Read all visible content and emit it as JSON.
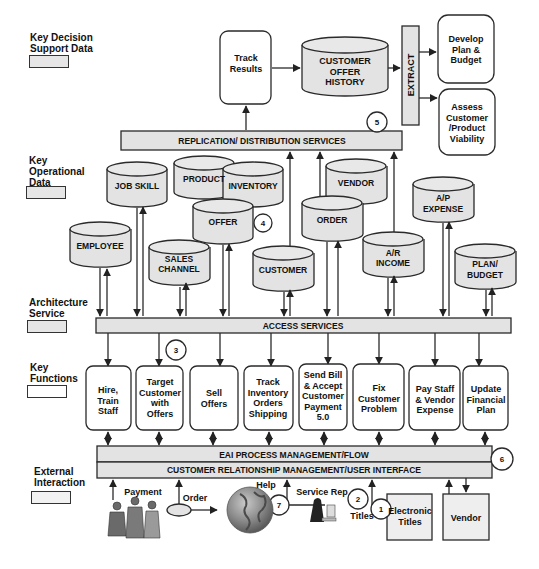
{
  "legend": [
    {
      "label": "Key Decision Support Data",
      "lines": [
        "Key  Decision",
        "Support  Data"
      ],
      "swatch_color": "#e6e6e6"
    },
    {
      "label": "Key Operational Data",
      "lines": [
        "Key",
        "Operational",
        "Data"
      ],
      "swatch_color": "#e6e6e6"
    },
    {
      "label": "Architecture Service",
      "lines": [
        "Architecture",
        "Service"
      ],
      "swatch_color": "#e6e6e6"
    },
    {
      "label": "Key Functions",
      "lines": [
        "Key",
        "Functions"
      ],
      "swatch_color": "#ffffff"
    },
    {
      "label": "External Interaction",
      "lines": [
        "External",
        "Interaction"
      ],
      "swatch_color": "#f2f2f2"
    }
  ],
  "decision_support": {
    "track_results": [
      "Track",
      "Results"
    ],
    "customer_offer_history": [
      "CUSTOMER",
      "OFFER",
      "HISTORY"
    ],
    "extract": "EXTRACT",
    "develop_plan": [
      "Develop",
      "Plan &",
      "Budget"
    ],
    "assess_viability": [
      "Assess",
      "Customer",
      "/Product",
      "Viability"
    ]
  },
  "services": {
    "replication": "REPLICATION/ DISTRIBUTION SERVICES",
    "access": "ACCESS SERVICES",
    "eai": "EAI PROCESS MANAGEMENT/FLOW",
    "crm": "CUSTOMER RELATIONSHIP MANAGEMENT/USER INTERFACE"
  },
  "operational_data": [
    {
      "id": "job-skill",
      "lines": [
        "JOB SKILL"
      ]
    },
    {
      "id": "product",
      "lines": [
        "PRODUCT"
      ]
    },
    {
      "id": "inventory",
      "lines": [
        "INVENTORY"
      ]
    },
    {
      "id": "vendor",
      "lines": [
        "VENDOR"
      ]
    },
    {
      "id": "offer",
      "lines": [
        "OFFER"
      ]
    },
    {
      "id": "order",
      "lines": [
        "ORDER"
      ]
    },
    {
      "id": "a-p-expense",
      "lines": [
        "A/P",
        "EXPENSE"
      ]
    },
    {
      "id": "employee",
      "lines": [
        "EMPLOYEE"
      ]
    },
    {
      "id": "sales-channel",
      "lines": [
        "SALES",
        "CHANNEL"
      ]
    },
    {
      "id": "customer",
      "lines": [
        "CUSTOMER"
      ]
    },
    {
      "id": "a-r-income",
      "lines": [
        "A/R",
        "INCOME"
      ]
    },
    {
      "id": "plan-budget",
      "lines": [
        "PLAN/",
        "BUDGET"
      ]
    }
  ],
  "functions": [
    {
      "id": "hire-train-staff",
      "lines": [
        "Hire,",
        "Train",
        "Staff"
      ]
    },
    {
      "id": "target-customer",
      "lines": [
        "Target",
        "Customer",
        "with",
        "Offers"
      ]
    },
    {
      "id": "sell-offers",
      "lines": [
        "Sell",
        "Offers"
      ]
    },
    {
      "id": "track-inventory",
      "lines": [
        "Track",
        "Inventory",
        "Orders",
        "Shipping"
      ]
    },
    {
      "id": "send-bill",
      "lines": [
        "Send Bill",
        "& Accept",
        "Customer",
        "Payment",
        "5.0"
      ]
    },
    {
      "id": "fix-customer-problem",
      "lines": [
        "Fix",
        "Customer",
        "Problem"
      ]
    },
    {
      "id": "pay-staff",
      "lines": [
        "Pay Staff",
        "& Vendor",
        "Expense"
      ]
    },
    {
      "id": "update-financial-plan",
      "lines": [
        "Update",
        "Financial",
        "Plan"
      ]
    }
  ],
  "external": {
    "payment": "Payment",
    "order": "Order",
    "help": "Help",
    "service_rep": "Service Rep",
    "titles": "Titles",
    "electronic_titles": [
      "Electronic",
      "Titles"
    ],
    "vendor": "Vendor"
  },
  "callouts": [
    "1",
    "2",
    "3",
    "4",
    "5",
    "6",
    "7"
  ],
  "colors": {
    "fill_gray": "#e3e3e3",
    "stroke": "#2a2a2a",
    "background": "#ffffff"
  }
}
